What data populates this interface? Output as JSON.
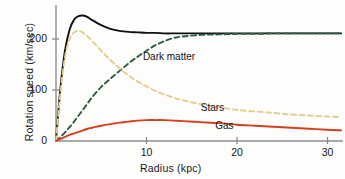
{
  "chart_data": {
    "type": "line",
    "title": "",
    "xlabel": "Radius (kpc)",
    "ylabel": "Rotation speed (km/sec)",
    "xlim": [
      0,
      31.5
    ],
    "ylim": [
      0,
      260
    ],
    "xticks": [
      10,
      20,
      30
    ],
    "yticks": [
      0,
      100,
      200
    ],
    "grid": false,
    "legend": "inline-annotations",
    "x": [
      0,
      0.5,
      1,
      1.5,
      2,
      2.5,
      3,
      3.5,
      4,
      5,
      6,
      7,
      8,
      9,
      10,
      11,
      12,
      13,
      14,
      16,
      18,
      20,
      22,
      24,
      26,
      28,
      30,
      31.5
    ],
    "series": [
      {
        "name": "Total",
        "color": "#111111",
        "style": "solid",
        "labelled": false,
        "values": [
          0,
          105,
          178,
          218,
          238,
          245,
          246,
          243,
          237,
          227,
          220,
          216,
          214,
          213,
          212,
          212,
          211,
          211,
          211,
          211,
          211,
          211,
          211,
          211,
          211,
          211,
          211,
          211
        ]
      },
      {
        "name": "Dark matter",
        "color": "#2f5b46",
        "style": "dashed",
        "labelled": true,
        "values": [
          0,
          8,
          17,
          27,
          38,
          50,
          62,
          74,
          86,
          106,
          122,
          137,
          152,
          165,
          177,
          188,
          196,
          202,
          205,
          208,
          209,
          210,
          210,
          211,
          211,
          211,
          211,
          211
        ]
      },
      {
        "name": "Stars",
        "color": "#e3cf93",
        "style": "dashed",
        "labelled": true,
        "values": [
          0,
          95,
          165,
          200,
          213,
          216,
          212,
          205,
          196,
          177,
          159,
          143,
          129,
          117,
          107,
          98,
          91,
          85,
          80,
          72,
          66,
          61,
          58,
          55,
          52,
          50,
          48,
          47
        ]
      },
      {
        "name": "Gas",
        "color": "#d4401b",
        "style": "solid",
        "labelled": true,
        "values": [
          0,
          4,
          8,
          12,
          15,
          18,
          21,
          24,
          26,
          30,
          33,
          36,
          38,
          40,
          41,
          41,
          41,
          40,
          39,
          37,
          35,
          32,
          30,
          28,
          26,
          24,
          22,
          21
        ]
      }
    ],
    "annotations": [
      {
        "text": "Dark matter",
        "x": 9.6,
        "y": 163
      },
      {
        "text": "Stars",
        "x": 16.0,
        "y": 63
      },
      {
        "text": "Gas",
        "x": 17.6,
        "y": 28
      }
    ]
  },
  "axes": {
    "y_tick_labels": [
      "0",
      "100",
      "200"
    ],
    "x_tick_labels": [
      "10",
      "20",
      "30"
    ],
    "x_title": "Radius (kpc)",
    "y_title": "Rotation speed (km/sec)",
    "axis_color": "#8c8c8c"
  }
}
